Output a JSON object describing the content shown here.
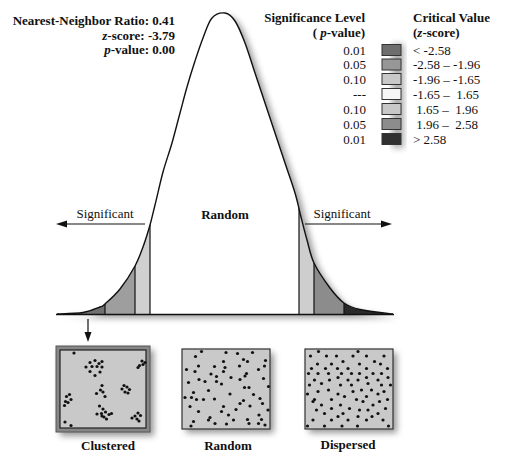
{
  "stats": {
    "ratio_label": "Nearest-Neighbor Ratio: ",
    "ratio_value": "0.41",
    "z_var": "z",
    "z_rest": "-score: ",
    "z_value": "-3.79",
    "p_var": "p",
    "p_rest": "-value: ",
    "p_value": "0.00"
  },
  "legend": {
    "sig_header": "Significance Level",
    "sig_sub_open": "( ",
    "sig_sub_var": "p",
    "sig_sub_rest": "-value)",
    "crit_header": "Critical Value",
    "crit_sub_open": "(",
    "crit_sub_var": "z",
    "crit_sub_rest": "-score)",
    "rows": [
      {
        "p": "0.01",
        "range": "< -2.58",
        "color": "#6e6e6e"
      },
      {
        "p": "0.05",
        "range": "-2.58 – -1.96",
        "color": "#979797"
      },
      {
        "p": "0.10",
        "range": "-1.96 – -1.65",
        "color": "#c8c8c8"
      },
      {
        "p": "---",
        "range": "-1.65 –  1.65",
        "color": "#f6f6f6"
      },
      {
        "p": "0.10",
        "range": " 1.65 –  1.96",
        "color": "#c8c8c8"
      },
      {
        "p": "0.05",
        "range": " 1.96 –  2.58",
        "color": "#8c8c8c"
      },
      {
        "p": "0.01",
        "range": "> 2.58",
        "color": "#303030"
      }
    ]
  },
  "curve_labels": {
    "center": "Random",
    "left": "Significant",
    "right": "Significant"
  },
  "patterns": {
    "clustered_label": "Clustered",
    "random_label": "Random",
    "dispersed_label": "Dispersed"
  },
  "figure": {
    "baseline_y": 314,
    "curve": {
      "points": [
        [
          57,
          314
        ],
        [
          83,
          312.5
        ],
        [
          100,
          307
        ],
        [
          105,
          304
        ],
        [
          120,
          289
        ],
        [
          135,
          266
        ],
        [
          143,
          247
        ],
        [
          150,
          225
        ],
        [
          155,
          205
        ],
        [
          163,
          172
        ],
        [
          172,
          143
        ],
        [
          180,
          113
        ],
        [
          187,
          87
        ],
        [
          195,
          61
        ],
        [
          203,
          38
        ],
        [
          212,
          18
        ],
        [
          225,
          13
        ],
        [
          235,
          21
        ],
        [
          245,
          43
        ],
        [
          255,
          73
        ],
        [
          265,
          103
        ],
        [
          275,
          133
        ],
        [
          285,
          163
        ],
        [
          295,
          193
        ],
        [
          301,
          217
        ],
        [
          307,
          240
        ],
        [
          314,
          263
        ],
        [
          330,
          288
        ],
        [
          344,
          303
        ],
        [
          360,
          309.5
        ],
        [
          393,
          314
        ]
      ]
    },
    "regions": [
      {
        "label": "z < -2.58",
        "x0": 50,
        "x1": 105,
        "color": "#707070"
      },
      {
        "label": "-2.58 to -1.96",
        "x0": 105,
        "x1": 135,
        "color": "#9e9e9e"
      },
      {
        "label": "-1.96 to -1.65",
        "x0": 135,
        "x1": 150,
        "color": "#d0d0d0"
      },
      {
        "label": "-1.65 to 1.65",
        "x0": 150,
        "x1": 299,
        "color": "#ffffff"
      },
      {
        "label": "1.65 to 1.96",
        "x0": 299,
        "x1": 314,
        "color": "#cecece"
      },
      {
        "label": "1.96 to 2.58",
        "x0": 314,
        "x1": 344,
        "color": "#8c8c8c"
      },
      {
        "label": "z > 2.58",
        "x0": 344,
        "x1": 400,
        "color": "#2a2a2a"
      }
    ],
    "separators": [
      105,
      135,
      150,
      299,
      314,
      344
    ],
    "dots": {
      "clustered": [
        [
          74,
          353
        ],
        [
          86,
          367
        ],
        [
          90,
          362.5
        ],
        [
          95,
          360.5
        ],
        [
          99,
          363.5
        ],
        [
          102,
          361.5
        ],
        [
          92,
          366.5
        ],
        [
          97,
          366.5
        ],
        [
          102,
          367
        ],
        [
          90,
          371.5
        ],
        [
          95,
          375.5
        ],
        [
          100,
          372
        ],
        [
          142,
          361
        ],
        [
          145,
          362.5
        ],
        [
          139.5,
          365.5
        ],
        [
          143,
          364.5
        ],
        [
          138,
          367.5
        ],
        [
          102,
          385.5
        ],
        [
          100.5,
          390
        ],
        [
          96.5,
          393.5
        ],
        [
          103,
          392
        ],
        [
          105,
          396.5
        ],
        [
          124,
          385.5
        ],
        [
          127,
          387
        ],
        [
          122,
          389
        ],
        [
          129.5,
          389.5
        ],
        [
          125,
          392
        ],
        [
          128,
          393
        ],
        [
          69.5,
          394.5
        ],
        [
          66.5,
          396.5
        ],
        [
          71,
          399.5
        ],
        [
          65.5,
          401.5
        ],
        [
          68,
          402.5
        ],
        [
          64.5,
          405.5
        ],
        [
          99.5,
          406
        ],
        [
          103,
          409
        ],
        [
          97,
          414
        ],
        [
          101.5,
          413.5
        ],
        [
          105.5,
          412
        ],
        [
          109,
          414.5
        ],
        [
          111.5,
          413.5
        ],
        [
          104,
          417
        ],
        [
          106.5,
          419
        ],
        [
          102,
          416
        ],
        [
          138,
          413
        ],
        [
          135,
          416
        ],
        [
          140.5,
          415.5
        ],
        [
          132,
          418
        ],
        [
          137,
          419
        ],
        [
          139,
          421
        ],
        [
          65,
          422
        ],
        [
          71,
          425.5
        ]
      ],
      "random": [
        [
          201.5,
          351.5
        ],
        [
          226,
          352.5
        ],
        [
          237.5,
          353.5
        ],
        [
          252.5,
          352.5
        ],
        [
          195.5,
          356.5
        ],
        [
          223.5,
          361.5
        ],
        [
          243.5,
          359.5
        ],
        [
          247.5,
          361.5
        ],
        [
          265.5,
          360.5
        ],
        [
          198.5,
          366
        ],
        [
          214.5,
          366.5
        ],
        [
          239.5,
          366
        ],
        [
          225,
          367.5
        ],
        [
          264.5,
          366
        ],
        [
          186.5,
          369.5
        ],
        [
          195,
          371.5
        ],
        [
          223.5,
          371.5
        ],
        [
          246.5,
          373.5
        ],
        [
          258.5,
          369.5
        ],
        [
          211,
          374
        ],
        [
          216.5,
          376.5
        ],
        [
          231,
          377.5
        ],
        [
          245,
          376
        ],
        [
          199,
          379.5
        ],
        [
          188.5,
          382.5
        ],
        [
          205,
          381.5
        ],
        [
          216.5,
          381.5
        ],
        [
          221.5,
          384
        ],
        [
          240,
          379.5
        ],
        [
          263.5,
          378.5
        ],
        [
          244.5,
          387.5
        ],
        [
          249,
          387.5
        ],
        [
          268.5,
          386.5
        ],
        [
          208.5,
          390.5
        ],
        [
          193.5,
          392.5
        ],
        [
          230,
          394
        ],
        [
          253.5,
          394.5
        ],
        [
          185,
          397.5
        ],
        [
          191.5,
          397.5
        ],
        [
          196.5,
          399.5
        ],
        [
          203.5,
          399.5
        ],
        [
          214.5,
          399
        ],
        [
          260,
          398.5
        ],
        [
          243.5,
          400.5
        ],
        [
          240,
          403.5
        ],
        [
          262.5,
          403.5
        ],
        [
          190,
          406.5
        ],
        [
          223.5,
          406.5
        ],
        [
          250,
          406
        ],
        [
          236,
          409.5
        ],
        [
          198.5,
          411.5
        ],
        [
          221.5,
          411.5
        ],
        [
          268,
          410
        ],
        [
          228.5,
          415
        ],
        [
          259,
          415
        ],
        [
          210,
          417.5
        ],
        [
          247.5,
          419.5
        ],
        [
          208.5,
          420
        ],
        [
          233.5,
          420
        ],
        [
          261.5,
          419.5
        ],
        [
          193.5,
          421.5
        ],
        [
          215,
          423.5
        ],
        [
          226.5,
          424
        ],
        [
          249,
          423.5
        ],
        [
          258.5,
          423.5
        ],
        [
          191,
          426
        ],
        [
          265,
          425
        ]
      ],
      "dispersed": [
        [
          318.5,
          351.5
        ],
        [
          358,
          351.5
        ],
        [
          310.5,
          356
        ],
        [
          326.5,
          356
        ],
        [
          336.5,
          356
        ],
        [
          353,
          356
        ],
        [
          366.5,
          356
        ],
        [
          384,
          356
        ],
        [
          343,
          361.5
        ],
        [
          374.5,
          361.5
        ],
        [
          317.5,
          364
        ],
        [
          331.5,
          364
        ],
        [
          359.5,
          364
        ],
        [
          380.5,
          364
        ],
        [
          311.5,
          368.5
        ],
        [
          325.5,
          368.5
        ],
        [
          337.5,
          368.5
        ],
        [
          348,
          368.5
        ],
        [
          366.5,
          368.5
        ],
        [
          387.5,
          368.5
        ],
        [
          308.5,
          373.5
        ],
        [
          318,
          373.5
        ],
        [
          328.5,
          373.5
        ],
        [
          341.5,
          373.5
        ],
        [
          351.5,
          373.5
        ],
        [
          359.5,
          373.5
        ],
        [
          373,
          373.5
        ],
        [
          381.5,
          373.5
        ],
        [
          338,
          377.5
        ],
        [
          366.5,
          377.5
        ],
        [
          388,
          377.5
        ],
        [
          314.5,
          380
        ],
        [
          329.5,
          380
        ],
        [
          348,
          380
        ],
        [
          358,
          380
        ],
        [
          378,
          380
        ],
        [
          321.5,
          383.5
        ],
        [
          368,
          383.5
        ],
        [
          309.5,
          385
        ],
        [
          340.5,
          385
        ],
        [
          351.5,
          385
        ],
        [
          381.5,
          385
        ],
        [
          390.5,
          385
        ],
        [
          328.5,
          390
        ],
        [
          361.5,
          390
        ],
        [
          371.5,
          390
        ],
        [
          318,
          391.5
        ],
        [
          353,
          391.5
        ],
        [
          384,
          391.5
        ],
        [
          307.5,
          394
        ],
        [
          338,
          394
        ],
        [
          378,
          394
        ],
        [
          344.5,
          396.5
        ],
        [
          366.5,
          396.5
        ],
        [
          314.5,
          399.5
        ],
        [
          331.5,
          399.5
        ],
        [
          356.5,
          399.5
        ],
        [
          387.5,
          399.5
        ],
        [
          313,
          401.5
        ],
        [
          363,
          401.5
        ],
        [
          379.5,
          401.5
        ],
        [
          321.5,
          405
        ],
        [
          340.5,
          405
        ],
        [
          373,
          405
        ],
        [
          331.5,
          408.5
        ],
        [
          349.5,
          408.5
        ],
        [
          385.5,
          408.5
        ],
        [
          316.5,
          410
        ],
        [
          359.5,
          410
        ],
        [
          368,
          410
        ],
        [
          324.5,
          413.5
        ],
        [
          343,
          413.5
        ],
        [
          378,
          413.5
        ],
        [
          338,
          416.5
        ],
        [
          358,
          416.5
        ],
        [
          372,
          416.5
        ],
        [
          313,
          420
        ],
        [
          331.5,
          420
        ],
        [
          348,
          420
        ],
        [
          366.5,
          420
        ],
        [
          383,
          420
        ],
        [
          307.5,
          426
        ],
        [
          324.5,
          426
        ],
        [
          342,
          426
        ],
        [
          357.5,
          426
        ],
        [
          388.5,
          426
        ]
      ]
    }
  }
}
